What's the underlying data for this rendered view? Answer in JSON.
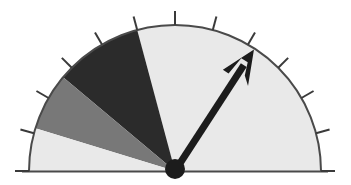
{
  "figure": {
    "kind": "gauge-dial",
    "background_color": "#ffffff"
  },
  "chart_data": {
    "type": "pie",
    "subtitle": "",
    "xlabel": "",
    "ylabel": "",
    "legend_position": "none",
    "grid": false,
    "geometry": {
      "center_x": 175,
      "center_y": 171,
      "radius": 146,
      "start_angle_deg": 180,
      "end_angle_deg": 0,
      "sweep_deg": 180,
      "baseline_y": 171,
      "baseline_x_start": 29,
      "baseline_x_end": 321
    },
    "categories": [
      "light-sector-right",
      "dark-sector",
      "medium-gray-sector",
      "light-sector-left"
    ],
    "values": [
      105,
      35,
      23,
      17
    ],
    "series": [
      {
        "name": "sectors",
        "values": [
          105,
          35,
          23,
          17
        ]
      }
    ],
    "sectors": [
      {
        "name": "light-sector-right",
        "start_angle_deg": 0,
        "end_angle_deg": 105,
        "span_deg": 105,
        "color": "#e9e9e9"
      },
      {
        "name": "dark-sector",
        "start_angle_deg": 105,
        "end_angle_deg": 140,
        "span_deg": 35,
        "color": "#2b2b2b"
      },
      {
        "name": "medium-gray-sector",
        "start_angle_deg": 140,
        "end_angle_deg": 163,
        "span_deg": 23,
        "color": "#787878"
      },
      {
        "name": "light-sector-left",
        "start_angle_deg": 163,
        "end_angle_deg": 180,
        "span_deg": 17,
        "color": "#e9e9e9"
      }
    ],
    "needle": {
      "angle_deg": 57,
      "pivot_x": 175,
      "pivot_y": 171,
      "tip_x": 254,
      "tip_y": 49,
      "length": 145,
      "color": "#1c1c1c",
      "shaft_width": 7,
      "hub_radius": 10,
      "arrowhead": true
    },
    "ticks": {
      "count": 13,
      "step_deg": 15,
      "first_angle_deg": 0,
      "last_angle_deg": 180,
      "inner_radius": 146,
      "outer_radius": 160,
      "color": "#3a3a3a",
      "width": 2,
      "labels": []
    },
    "outline": {
      "color": "#4a4a4a",
      "width": 2
    },
    "colors": {
      "light": "#e9e9e9",
      "dark": "#2b2b2b",
      "medium": "#787878",
      "needle": "#1c1c1c",
      "outline": "#4a4a4a",
      "tick": "#3a3a3a",
      "background": "#ffffff"
    }
  }
}
